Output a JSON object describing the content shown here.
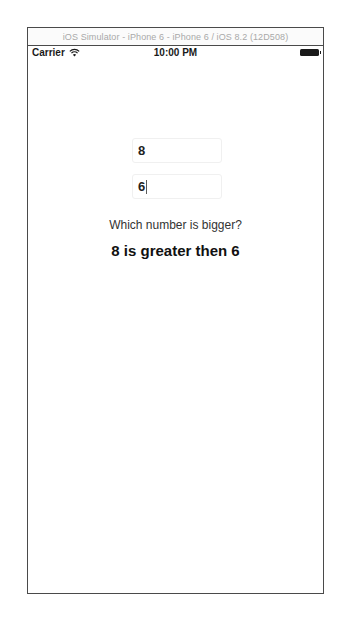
{
  "window": {
    "title": "iOS Simulator - iPhone 6 - iPhone 6 / iOS 8.2 (12D508)"
  },
  "status_bar": {
    "carrier": "Carrier",
    "wifi_icon": "wifi-icon",
    "time": "10:00 PM",
    "battery_icon": "battery-icon"
  },
  "form": {
    "first_number": "8",
    "second_number": "6",
    "focused_field": "second_number"
  },
  "labels": {
    "question": "Which number is bigger?",
    "result": "8 is greater then 6"
  }
}
